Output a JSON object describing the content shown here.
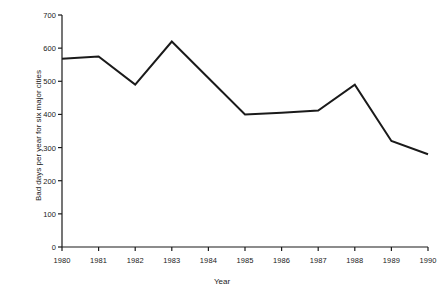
{
  "chart_data": {
    "type": "line",
    "title": "",
    "xlabel": "Year",
    "ylabel": "Bad days per year for six major cities",
    "categories": [
      "1980",
      "1981",
      "1982",
      "1983",
      "1984",
      "1985",
      "1986",
      "1987",
      "1988",
      "1989",
      "1990"
    ],
    "x": [
      1980,
      1981,
      1982,
      1983,
      1984,
      1985,
      1986,
      1987,
      1988,
      1989,
      1990
    ],
    "values": [
      568,
      575,
      490,
      620,
      510,
      400,
      405,
      412,
      490,
      320,
      280
    ],
    "series": [
      {
        "name": "Bad days per year for six major cities",
        "values": [
          568,
          575,
          490,
          620,
          510,
          400,
          405,
          412,
          490,
          320,
          280
        ]
      }
    ],
    "xlim": [
      1980,
      1990
    ],
    "ylim": [
      0,
      700
    ],
    "yticks": [
      0,
      100,
      200,
      300,
      400,
      500,
      600,
      700
    ],
    "ytick_labels": [
      "0",
      "100",
      "200",
      "300",
      "400",
      "500",
      "600",
      "700"
    ],
    "xtick_labels": [
      "1980",
      "1981",
      "1982",
      "1983",
      "1984",
      "1985",
      "1986",
      "1987",
      "1988",
      "1989",
      "1990"
    ],
    "grid": false,
    "legend": "none",
    "line_color": "#1a1a1a",
    "axis_color": "#1a1a1a",
    "background_color": "#ffffff"
  }
}
